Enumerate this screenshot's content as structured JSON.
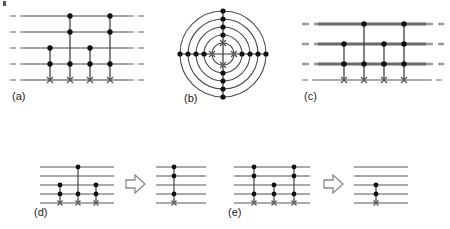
{
  "figure": {
    "type": "quantum-circuit-diagram",
    "panel_count": 5,
    "colors": {
      "wire_thin": "#808080",
      "wire_thick": "#6b6b6b",
      "dash": "#9a9a9a",
      "node": "#111111",
      "vertical_line": "#444444",
      "target_x": "#555555",
      "circle_stroke": "#4d4d4d",
      "arrow_stroke": "#8a8a8a",
      "label_text": "#1a1a1a"
    },
    "panels": [
      {
        "id": "a",
        "label": "(a)",
        "kind": "linear-circuit",
        "wire_count": 5,
        "dashed_ends": true,
        "thick_wires": [],
        "columns": [
          {
            "controls": [
              3,
              4
            ],
            "target": 5
          },
          {
            "controls": [
              1,
              2,
              4
            ],
            "target": 5
          },
          {
            "controls": [
              3,
              4
            ],
            "target": 5
          },
          {
            "controls": [
              1,
              2,
              4
            ],
            "target": 5
          }
        ]
      },
      {
        "id": "b",
        "label": "(b)",
        "kind": "concentric-circles",
        "circle_count": 5,
        "spokes": [
          "east",
          "west",
          "north",
          "south"
        ],
        "nodes_per_spoke": 4,
        "targets_on_circle": 1,
        "target_count": 4
      },
      {
        "id": "c",
        "label": "(c)",
        "kind": "linear-circuit",
        "wire_count": 4,
        "dashed_ends": true,
        "thick_wires": [
          1,
          2,
          3
        ],
        "columns": [
          {
            "controls": [
              2,
              3
            ],
            "target": 4
          },
          {
            "controls": [
              1,
              3
            ],
            "target": 4
          },
          {
            "controls": [
              2,
              3
            ],
            "target": 4
          },
          {
            "controls": [
              1,
              2,
              3
            ],
            "target": 4
          }
        ]
      },
      {
        "id": "d",
        "label": "(d)",
        "kind": "rewrite-rule",
        "arrow": "hollow-right-arrow",
        "lhs": {
          "wire_count": 5,
          "columns": [
            {
              "controls": [
                3,
                4
              ],
              "target": 5
            },
            {
              "controls": [
                1,
                4
              ],
              "target": 5
            },
            {
              "controls": [
                3,
                4
              ],
              "target": 5
            }
          ]
        },
        "rhs": {
          "wire_count": 5,
          "columns": [
            {
              "controls": [
                1,
                2,
                4
              ],
              "target": 5
            }
          ]
        }
      },
      {
        "id": "e",
        "label": "(e)",
        "kind": "rewrite-rule",
        "arrow": "hollow-right-arrow",
        "lhs": {
          "wire_count": 5,
          "columns": [
            {
              "controls": [
                1,
                2,
                4
              ],
              "target": 5
            },
            {
              "controls": [
                3,
                4
              ],
              "target": 5
            },
            {
              "controls": [
                1,
                2,
                4
              ],
              "target": 5
            }
          ]
        },
        "rhs": {
          "wire_count": 5,
          "columns": [
            {
              "controls": [
                3,
                4
              ],
              "target": 5
            }
          ]
        }
      }
    ]
  }
}
